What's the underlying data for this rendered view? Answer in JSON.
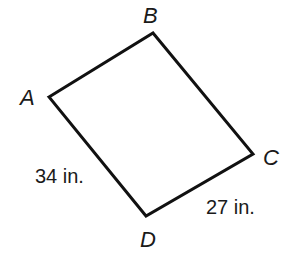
{
  "figure": {
    "type": "quadrilateral",
    "stroke_color": "#111111",
    "fill_color": "#ffffff",
    "vertices": [
      {
        "name": "A",
        "x": 49,
        "y": 97
      },
      {
        "name": "B",
        "x": 153,
        "y": 33
      },
      {
        "name": "C",
        "x": 253,
        "y": 154
      },
      {
        "name": "D",
        "x": 146,
        "y": 216
      }
    ],
    "vertex_labels": {
      "A": "A",
      "B": "B",
      "C": "C",
      "D": "D"
    },
    "side_labels": {
      "AD": "34 in.",
      "DC": "27 in."
    }
  }
}
